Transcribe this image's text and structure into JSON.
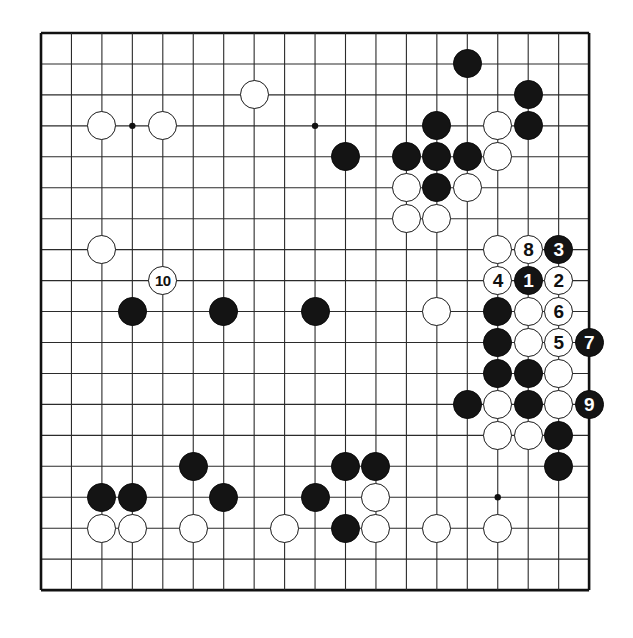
{
  "diagram": {
    "kind": "go-board-diagram",
    "board_size": 19,
    "grid": {
      "left": 41,
      "top": 33,
      "step_x": 30.45,
      "step_y": 30.95,
      "line_color": "#2b2b2b",
      "border_color": "#111111",
      "background": "#ffffff"
    },
    "star_points": [
      {
        "col": 3,
        "row": 3
      },
      {
        "col": 9,
        "row": 3
      },
      {
        "col": 15,
        "row": 3
      },
      {
        "col": 3,
        "row": 9
      },
      {
        "col": 9,
        "row": 9
      },
      {
        "col": 15,
        "row": 9
      },
      {
        "col": 3,
        "row": 15
      },
      {
        "col": 9,
        "row": 15
      },
      {
        "col": 15,
        "row": 15
      }
    ],
    "stone_radius": 14.5,
    "colors": {
      "black": "#141414",
      "white": "#ffffff",
      "black_label": "#ffffff",
      "white_label": "#101010"
    },
    "stones": [
      {
        "col": 14,
        "row": 1,
        "color": "black",
        "label": ""
      },
      {
        "col": 16,
        "row": 2,
        "color": "black",
        "label": ""
      },
      {
        "col": 7,
        "row": 2,
        "color": "white",
        "label": ""
      },
      {
        "col": 2,
        "row": 3,
        "color": "white",
        "label": ""
      },
      {
        "col": 4,
        "row": 3,
        "color": "white",
        "label": ""
      },
      {
        "col": 13,
        "row": 3,
        "color": "black",
        "label": ""
      },
      {
        "col": 15,
        "row": 3,
        "color": "white",
        "label": ""
      },
      {
        "col": 16,
        "row": 3,
        "color": "black",
        "label": ""
      },
      {
        "col": 10,
        "row": 4,
        "color": "black",
        "label": ""
      },
      {
        "col": 12,
        "row": 4,
        "color": "black",
        "label": ""
      },
      {
        "col": 13,
        "row": 4,
        "color": "black",
        "label": ""
      },
      {
        "col": 14,
        "row": 4,
        "color": "black",
        "label": ""
      },
      {
        "col": 15,
        "row": 4,
        "color": "white",
        "label": ""
      },
      {
        "col": 12,
        "row": 5,
        "color": "white",
        "label": ""
      },
      {
        "col": 13,
        "row": 5,
        "color": "black",
        "label": ""
      },
      {
        "col": 14,
        "row": 5,
        "color": "white",
        "label": ""
      },
      {
        "col": 12,
        "row": 6,
        "color": "white",
        "label": ""
      },
      {
        "col": 13,
        "row": 6,
        "color": "white",
        "label": ""
      },
      {
        "col": 2,
        "row": 7,
        "color": "white",
        "label": ""
      },
      {
        "col": 15,
        "row": 7,
        "color": "white",
        "label": ""
      },
      {
        "col": 16,
        "row": 7,
        "color": "white",
        "label": "8"
      },
      {
        "col": 17,
        "row": 7,
        "color": "black",
        "label": "3"
      },
      {
        "col": 4,
        "row": 8,
        "color": "white",
        "label": "10"
      },
      {
        "col": 15,
        "row": 8,
        "color": "white",
        "label": "4"
      },
      {
        "col": 16,
        "row": 8,
        "color": "black",
        "label": "1"
      },
      {
        "col": 17,
        "row": 8,
        "color": "white",
        "label": "2"
      },
      {
        "col": 3,
        "row": 9,
        "color": "black",
        "label": ""
      },
      {
        "col": 6,
        "row": 9,
        "color": "black",
        "label": ""
      },
      {
        "col": 9,
        "row": 9,
        "color": "black",
        "label": ""
      },
      {
        "col": 13,
        "row": 9,
        "color": "white",
        "label": ""
      },
      {
        "col": 15,
        "row": 9,
        "color": "black",
        "label": ""
      },
      {
        "col": 16,
        "row": 9,
        "color": "white",
        "label": ""
      },
      {
        "col": 17,
        "row": 9,
        "color": "white",
        "label": "6"
      },
      {
        "col": 15,
        "row": 10,
        "color": "black",
        "label": ""
      },
      {
        "col": 16,
        "row": 10,
        "color": "white",
        "label": ""
      },
      {
        "col": 17,
        "row": 10,
        "color": "white",
        "label": "5"
      },
      {
        "col": 18,
        "row": 10,
        "color": "black",
        "label": "7"
      },
      {
        "col": 15,
        "row": 11,
        "color": "black",
        "label": ""
      },
      {
        "col": 16,
        "row": 11,
        "color": "black",
        "label": ""
      },
      {
        "col": 17,
        "row": 11,
        "color": "white",
        "label": ""
      },
      {
        "col": 14,
        "row": 12,
        "color": "black",
        "label": ""
      },
      {
        "col": 15,
        "row": 12,
        "color": "white",
        "label": ""
      },
      {
        "col": 16,
        "row": 12,
        "color": "black",
        "label": ""
      },
      {
        "col": 17,
        "row": 12,
        "color": "white",
        "label": ""
      },
      {
        "col": 18,
        "row": 12,
        "color": "black",
        "label": "9"
      },
      {
        "col": 15,
        "row": 13,
        "color": "white",
        "label": ""
      },
      {
        "col": 16,
        "row": 13,
        "color": "white",
        "label": ""
      },
      {
        "col": 17,
        "row": 13,
        "color": "black",
        "label": ""
      },
      {
        "col": 17,
        "row": 14,
        "color": "black",
        "label": ""
      },
      {
        "col": 5,
        "row": 14,
        "color": "black",
        "label": ""
      },
      {
        "col": 10,
        "row": 14,
        "color": "black",
        "label": ""
      },
      {
        "col": 11,
        "row": 14,
        "color": "black",
        "label": ""
      },
      {
        "col": 2,
        "row": 15,
        "color": "black",
        "label": ""
      },
      {
        "col": 3,
        "row": 15,
        "color": "black",
        "label": ""
      },
      {
        "col": 6,
        "row": 15,
        "color": "black",
        "label": ""
      },
      {
        "col": 9,
        "row": 15,
        "color": "black",
        "label": ""
      },
      {
        "col": 11,
        "row": 15,
        "color": "white",
        "label": ""
      },
      {
        "col": 2,
        "row": 16,
        "color": "white",
        "label": ""
      },
      {
        "col": 3,
        "row": 16,
        "color": "white",
        "label": ""
      },
      {
        "col": 5,
        "row": 16,
        "color": "white",
        "label": ""
      },
      {
        "col": 8,
        "row": 16,
        "color": "white",
        "label": ""
      },
      {
        "col": 10,
        "row": 16,
        "color": "black",
        "label": ""
      },
      {
        "col": 11,
        "row": 16,
        "color": "white",
        "label": ""
      },
      {
        "col": 13,
        "row": 16,
        "color": "white",
        "label": ""
      },
      {
        "col": 15,
        "row": 16,
        "color": "white",
        "label": ""
      }
    ],
    "move_labels": [
      "1",
      "2",
      "3",
      "4",
      "5",
      "6",
      "7",
      "8",
      "9",
      "10"
    ]
  }
}
